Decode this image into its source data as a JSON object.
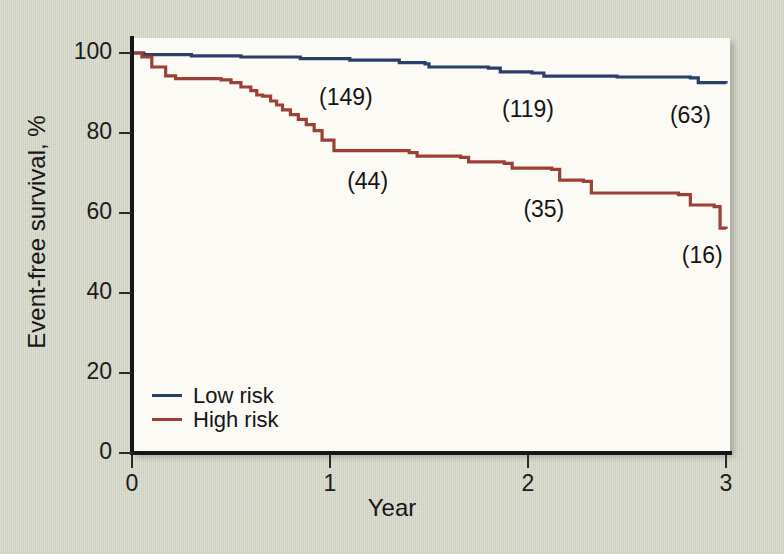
{
  "chart_data": {
    "type": "line",
    "title": "",
    "xlabel": "Year",
    "ylabel": "Event-free survival, %",
    "xlim": [
      0,
      3
    ],
    "ylim": [
      0,
      100
    ],
    "xticks": [
      "0",
      "1",
      "2",
      "3"
    ],
    "yticks": [
      "0",
      "20",
      "40",
      "60",
      "80",
      "100"
    ],
    "grid": false,
    "legend_position": "inside-lower-left",
    "series": [
      {
        "name": "Low risk",
        "color": "#2b3f6b",
        "points": [
          [
            0.0,
            100.0
          ],
          [
            0.06,
            99.6
          ],
          [
            0.3,
            99.3
          ],
          [
            0.55,
            99.0
          ],
          [
            0.85,
            98.6
          ],
          [
            1.1,
            98.2
          ],
          [
            1.35,
            97.6
          ],
          [
            1.48,
            97.3
          ],
          [
            1.5,
            96.5
          ],
          [
            1.8,
            96.2
          ],
          [
            1.86,
            95.3
          ],
          [
            2.02,
            95.0
          ],
          [
            2.08,
            94.2
          ],
          [
            2.45,
            94.0
          ],
          [
            2.82,
            93.8
          ],
          [
            2.86,
            92.6
          ],
          [
            3.0,
            92.4
          ]
        ]
      },
      {
        "name": "High risk",
        "color": "#9e3f36",
        "points": [
          [
            0.0,
            100.0
          ],
          [
            0.05,
            99.0
          ],
          [
            0.1,
            96.5
          ],
          [
            0.17,
            94.3
          ],
          [
            0.22,
            93.6
          ],
          [
            0.45,
            93.3
          ],
          [
            0.5,
            92.6
          ],
          [
            0.55,
            91.5
          ],
          [
            0.6,
            90.6
          ],
          [
            0.63,
            89.5
          ],
          [
            0.66,
            89.2
          ],
          [
            0.7,
            88.0
          ],
          [
            0.73,
            87.0
          ],
          [
            0.76,
            85.8
          ],
          [
            0.8,
            84.6
          ],
          [
            0.84,
            83.4
          ],
          [
            0.88,
            82.1
          ],
          [
            0.92,
            80.6
          ],
          [
            0.96,
            78.2
          ],
          [
            1.02,
            75.6
          ],
          [
            1.4,
            75.1
          ],
          [
            1.44,
            74.2
          ],
          [
            1.66,
            73.9
          ],
          [
            1.7,
            72.8
          ],
          [
            1.88,
            72.4
          ],
          [
            1.92,
            71.2
          ],
          [
            2.12,
            70.9
          ],
          [
            2.16,
            68.2
          ],
          [
            2.28,
            67.9
          ],
          [
            2.32,
            65.0
          ],
          [
            2.76,
            64.6
          ],
          [
            2.82,
            62.0
          ],
          [
            2.94,
            61.6
          ],
          [
            2.97,
            56.2
          ],
          [
            3.0,
            56.0
          ]
        ]
      }
    ],
    "annotations": [
      {
        "label": "(149)",
        "x": 1.08,
        "y": 88.5,
        "series": "Low risk"
      },
      {
        "label": "(119)",
        "x": 2.0,
        "y": 85.5,
        "series": "Low risk"
      },
      {
        "label": "(63)",
        "x": 2.82,
        "y": 84.0,
        "series": "Low risk"
      },
      {
        "label": "(44)",
        "x": 1.19,
        "y": 67.5,
        "series": "High risk"
      },
      {
        "label": "(35)",
        "x": 2.08,
        "y": 60.5,
        "series": "High risk"
      },
      {
        "label": "(16)",
        "x": 2.88,
        "y": 49.0,
        "series": "High risk"
      }
    ]
  },
  "legend": {
    "items": [
      {
        "label": "Low risk",
        "color": "#2b3f6b"
      },
      {
        "label": "High risk",
        "color": "#9e3f36"
      }
    ]
  },
  "colors": {
    "background": "#d3d5c5",
    "plot_background": "#fbfaf5",
    "axis": "#16161a",
    "low_risk": "#2b3f6b",
    "high_risk": "#9e3f36"
  }
}
